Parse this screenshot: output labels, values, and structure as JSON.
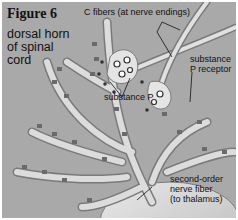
{
  "figure": {
    "title": "Figure 6",
    "region_label": "dorsal horn of spinal cord"
  },
  "labels": {
    "c_fibers": "C fibers (at nerve endings)",
    "substance_p": "substance P",
    "substance_p_receptor_line1": "substance",
    "substance_p_receptor_line2": "P receptor",
    "second_order_line1": "second-order",
    "second_order_line2": "nerve fiber",
    "second_order_line3": "(to thalamus)"
  },
  "colors": {
    "background": "#a9a9a9",
    "neuron_fill": "#d8d8d8",
    "neuron_edge": "#7a7a7a",
    "receptor": "#555555",
    "text": "#111111"
  }
}
